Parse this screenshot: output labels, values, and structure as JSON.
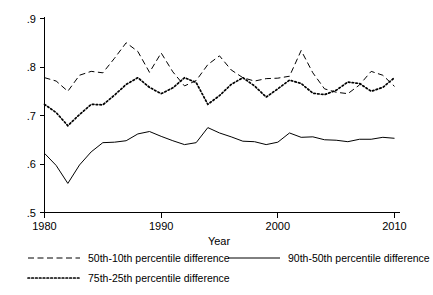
{
  "chart_data": {
    "type": "line",
    "title": "",
    "subtitle": "",
    "xlabel": "Year",
    "ylabel": "",
    "xlim": [
      1979,
      2010.6
    ],
    "ylim": [
      0.5,
      0.9
    ],
    "grid": false,
    "legend_position": "bottom",
    "xticks": [
      1980,
      1990,
      2000,
      2010
    ],
    "xtick_labels": [
      "1980",
      "1990",
      "2000",
      "2010"
    ],
    "yticks": [
      0.5,
      0.6,
      0.7,
      0.8,
      0.9
    ],
    "ytick_labels": [
      ".5",
      ".6",
      ".7",
      ".8",
      ".9"
    ],
    "x": [
      1980,
      1981,
      1982,
      1983,
      1984,
      1985,
      1986,
      1987,
      1988,
      1989,
      1990,
      1991,
      1992,
      1993,
      1994,
      1995,
      1996,
      1997,
      1998,
      1999,
      2000,
      2001,
      2002,
      2003,
      2004,
      2005,
      2006,
      2007,
      2008,
      2009,
      2010
    ],
    "series": [
      {
        "name": "50th-10th percentile difference",
        "style": "dashed",
        "values": [
          0.778,
          0.771,
          0.75,
          0.783,
          0.791,
          0.788,
          0.818,
          0.85,
          0.832,
          0.789,
          0.829,
          0.79,
          0.761,
          0.772,
          0.805,
          0.823,
          0.794,
          0.778,
          0.771,
          0.776,
          0.777,
          0.781,
          0.834,
          0.788,
          0.755,
          0.748,
          0.745,
          0.763,
          0.791,
          0.783,
          0.76
        ]
      },
      {
        "name": "75th-25th percentile difference",
        "style": "dotted",
        "values": [
          0.723,
          0.706,
          0.679,
          0.702,
          0.723,
          0.722,
          0.742,
          0.764,
          0.778,
          0.758,
          0.745,
          0.757,
          0.778,
          0.768,
          0.723,
          0.741,
          0.764,
          0.778,
          0.761,
          0.738,
          0.755,
          0.773,
          0.766,
          0.746,
          0.743,
          0.752,
          0.769,
          0.766,
          0.75,
          0.758,
          0.778
        ]
      },
      {
        "name": "90th-50th percentile difference",
        "style": "solid",
        "values": [
          0.622,
          0.597,
          0.56,
          0.598,
          0.625,
          0.644,
          0.645,
          0.648,
          0.662,
          0.667,
          0.657,
          0.648,
          0.64,
          0.644,
          0.675,
          0.664,
          0.656,
          0.647,
          0.646,
          0.64,
          0.645,
          0.664,
          0.655,
          0.656,
          0.65,
          0.649,
          0.646,
          0.651,
          0.651,
          0.655,
          0.653
        ]
      }
    ]
  },
  "axis": {
    "x_title": "Year"
  },
  "legend": {
    "entries": [
      {
        "label": "50th-10th percentile difference",
        "style": "dashed"
      },
      {
        "label": "90th-50th percentile difference",
        "style": "solid"
      },
      {
        "label": "75th-25th percentile difference",
        "style": "dotted"
      }
    ]
  }
}
